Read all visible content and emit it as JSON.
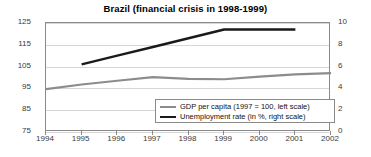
{
  "chart_data": {
    "type": "line",
    "title": "Brazil (financial crisis in 1998-1999)",
    "xlabel": "",
    "ylabel": "",
    "x": [
      1994,
      1995,
      1996,
      1997,
      1998,
      1999,
      2000,
      2001,
      2002
    ],
    "xlim": [
      1994,
      2002
    ],
    "xticks": [
      "1994",
      "1995",
      "1996",
      "1997",
      "1998",
      "1999",
      "2000",
      "2001",
      "2002"
    ],
    "grid": true,
    "legend_position": "bottom-center",
    "axes": [
      {
        "id": "left",
        "label": "GDP per capita (1997 = 100)",
        "ylim": [
          75,
          125
        ],
        "yticks": [
          "75",
          "85",
          "95",
          "105",
          "115",
          "125"
        ],
        "ytick_values": [
          75,
          85,
          95,
          105,
          115,
          125
        ]
      },
      {
        "id": "right",
        "label": "Unemployment rate (in %)",
        "ylim": [
          0,
          10
        ],
        "yticks": [
          "0",
          "2",
          "4",
          "6",
          "8",
          "10"
        ],
        "ytick_values": [
          0,
          2,
          4,
          6,
          8,
          10
        ]
      }
    ],
    "series": [
      {
        "name": "GDP per capita (1997 = 100, left scale)",
        "axis": "left",
        "color": "#8c8c8c",
        "x": [
          1994,
          1995,
          1996,
          1997,
          1998,
          1999,
          2000,
          2001,
          2002
        ],
        "values": [
          94.7,
          96.8,
          98.5,
          100.2,
          99.4,
          99.2,
          100.4,
          101.4,
          102.0
        ]
      },
      {
        "name": "Unemployment rate (in %, right scale)",
        "axis": "right",
        "color": "#1a1a1a",
        "x": [
          1995,
          1996,
          1997,
          1998,
          1999,
          2000,
          2001
        ],
        "values": [
          6.2,
          7.0,
          7.8,
          8.6,
          9.4,
          9.4,
          9.4
        ]
      }
    ]
  },
  "legend": {
    "items": [
      {
        "label": "GDP per capita (1997 = 100, left scale)",
        "color": "#8c8c8c"
      },
      {
        "label": "Unemployment rate (in %, right scale)",
        "color": "#1a1a1a"
      }
    ]
  }
}
